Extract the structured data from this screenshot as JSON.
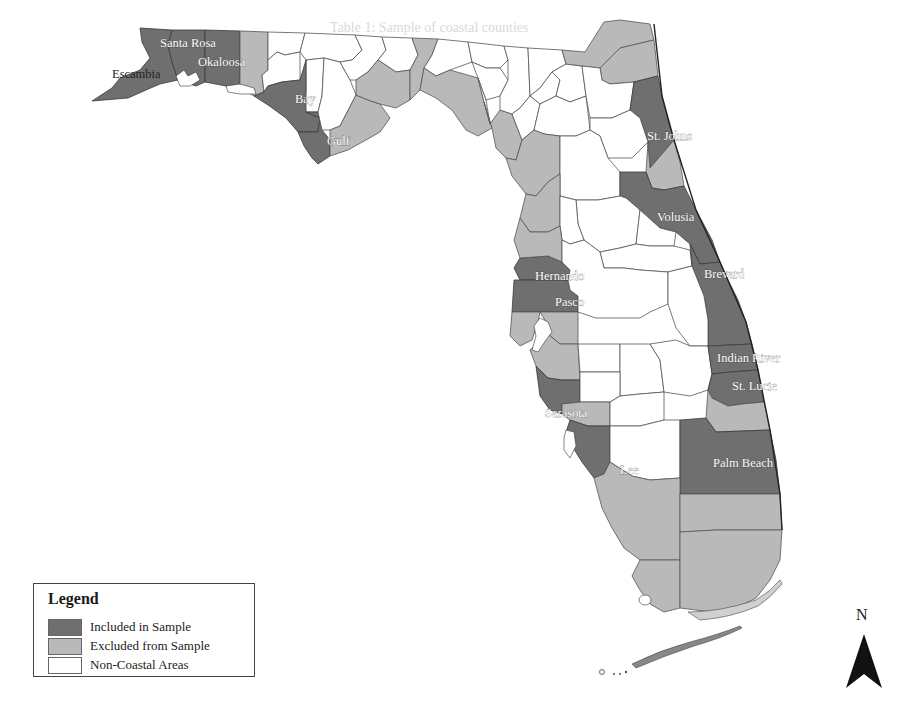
{
  "figure": {
    "type": "choropleth map",
    "region": "Florida counties",
    "background_bleed_text": {
      "top": "Table 1: Sample of coastal counties",
      "right_column": [
        "Area in",
        "Square",
        "Miles"
      ]
    }
  },
  "legend": {
    "title": "Legend",
    "items": [
      {
        "label": "Included in Sample",
        "color": "#6f6f6f"
      },
      {
        "label": "Excluded from Sample",
        "color": "#b9b9b9"
      },
      {
        "label": "Non-Coastal Areas",
        "color": "#ffffff"
      }
    ]
  },
  "north_arrow": {
    "label": "N"
  },
  "counties": {
    "included": [
      {
        "name": "Escambia"
      },
      {
        "name": "Santa Rosa"
      },
      {
        "name": "Okaloosa"
      },
      {
        "name": "Bay"
      },
      {
        "name": "Gulf"
      },
      {
        "name": "St. Johns"
      },
      {
        "name": "Volusia"
      },
      {
        "name": "Brevard"
      },
      {
        "name": "Hernando"
      },
      {
        "name": "Pasco"
      },
      {
        "name": "Indian River"
      },
      {
        "name": "St. Lucie"
      },
      {
        "name": "Sarasota"
      },
      {
        "name": "Lee"
      },
      {
        "name": "Palm Beach"
      }
    ]
  },
  "labels": {
    "escambia": "Escambia",
    "santa_rosa": "Santa Rosa",
    "okaloosa": "Okaloosa",
    "bay": "Bay",
    "gulf": "Gulf",
    "st_johns": "St. Johns",
    "volusia": "Volusia",
    "brevard": "Brevard",
    "hernando": "Hernando",
    "pasco": "Pasco",
    "indian_river": "Indian River",
    "st_lucie": "St. Lucie",
    "sarasota": "Sarasota",
    "lee": "Lee",
    "palm_beach": "Palm Beach"
  }
}
